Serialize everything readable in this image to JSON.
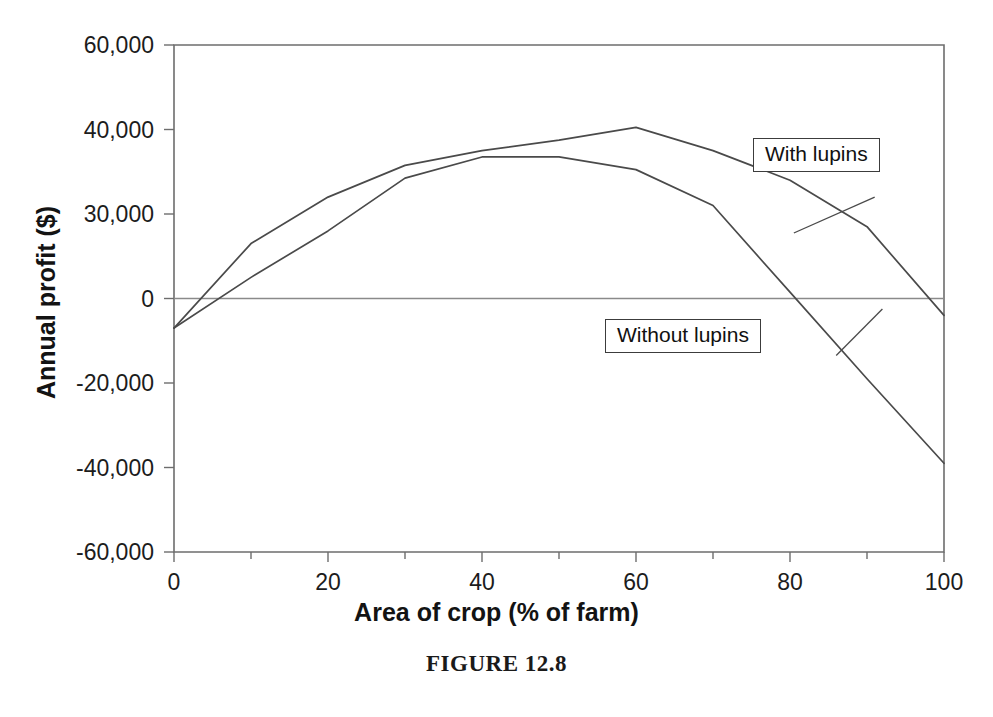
{
  "caption": "FIGURE 12.8",
  "callouts": {
    "with_lupins": "With lupins",
    "without_lupins": "Without lupins"
  },
  "chart_data": {
    "type": "line",
    "title": "",
    "xlabel": "Area of crop (% of farm)",
    "ylabel": "Annual profit ($)",
    "xlim": [
      0,
      100
    ],
    "ylim": [
      -60000,
      60000
    ],
    "xticks": [
      0,
      20,
      40,
      60,
      80,
      100
    ],
    "xtick_labels": [
      "0",
      "20",
      "40",
      "60",
      "80",
      "100"
    ],
    "xminor_ticks": [
      10,
      30,
      50,
      70,
      90
    ],
    "yticks": [
      60000,
      40000,
      20000,
      0,
      -20000,
      -40000,
      -60000
    ],
    "ytick_labels": [
      "60,000",
      "40,000",
      "30,000",
      "0",
      "-20,000",
      "-40,000",
      "-60,000"
    ],
    "grid": false,
    "zero_line": true,
    "legend": "annotated-callouts",
    "series": [
      {
        "name": "With lupins",
        "x": [
          0,
          10,
          20,
          30,
          40,
          50,
          60,
          70,
          80,
          90,
          100
        ],
        "values": [
          -7000,
          13000,
          24000,
          31500,
          35000,
          37500,
          40500,
          35000,
          28000,
          17000,
          -4000
        ]
      },
      {
        "name": "Without lupins",
        "x": [
          0,
          10,
          20,
          30,
          40,
          50,
          60,
          70,
          80,
          90,
          100
        ],
        "values": [
          -7000,
          5000,
          16000,
          28500,
          33500,
          33500,
          30500,
          22000,
          1500,
          -19000,
          -39000
        ]
      }
    ],
    "annotations": [
      {
        "text": "With lupins",
        "series": "With lupins",
        "leader_from": [
          91,
          24000
        ],
        "leader_to": [
          80.5,
          15500
        ]
      },
      {
        "text": "Without lupins",
        "series": "Without lupins",
        "leader_from": [
          86,
          -13500
        ],
        "leader_to": [
          92,
          -2500
        ]
      }
    ]
  }
}
